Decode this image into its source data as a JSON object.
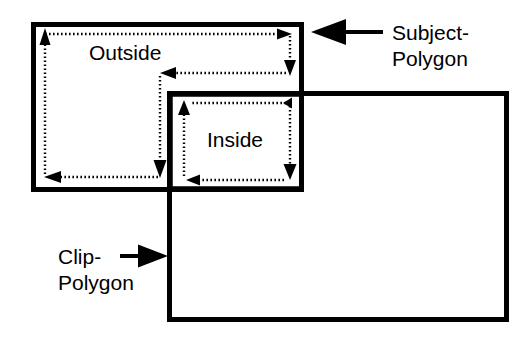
{
  "figure": {
    "background_color": "#ffffff",
    "ink_color": "#000000",
    "width": 532,
    "height": 337
  },
  "labels": {
    "outside": "Outside",
    "inside": "Inside",
    "subject_line1": "Subject-",
    "subject_line2": "Polygon",
    "clip_line1": "Clip-",
    "clip_line2": "Polygon"
  },
  "shapes": {
    "subject_polygon": {
      "name": "Subject-Polygon",
      "x": 33,
      "y": 24,
      "width": 269,
      "height": 166,
      "stroke": "#000000"
    },
    "clip_polygon": {
      "name": "Clip-Polygon",
      "x": 169,
      "y": 93,
      "width": 338,
      "height": 227,
      "stroke": "#000000"
    },
    "inside_region": {
      "name": "Inside",
      "x": 170,
      "y": 94,
      "width": 132,
      "height": 95,
      "stroke": "#000000"
    }
  },
  "traversals": [
    {
      "name": "outside-loop",
      "region": "Outside",
      "direction": "counter-clockwise",
      "style": "dotted",
      "arrow_count": 5
    },
    {
      "name": "inside-loop",
      "region": "Inside",
      "direction": "clockwise",
      "style": "dotted",
      "arrow_count": 4
    }
  ],
  "callouts": [
    {
      "name": "subject-polygon-callout",
      "text_line1": "Subject-",
      "text_line2": "Polygon",
      "arrow_direction": "left",
      "text_x": 390,
      "text_y": 25
    },
    {
      "name": "clip-polygon-callout",
      "text_line1": "Clip-",
      "text_line2": "Polygon",
      "arrow_direction": "right",
      "text_x": 58,
      "text_y": 248
    }
  ]
}
